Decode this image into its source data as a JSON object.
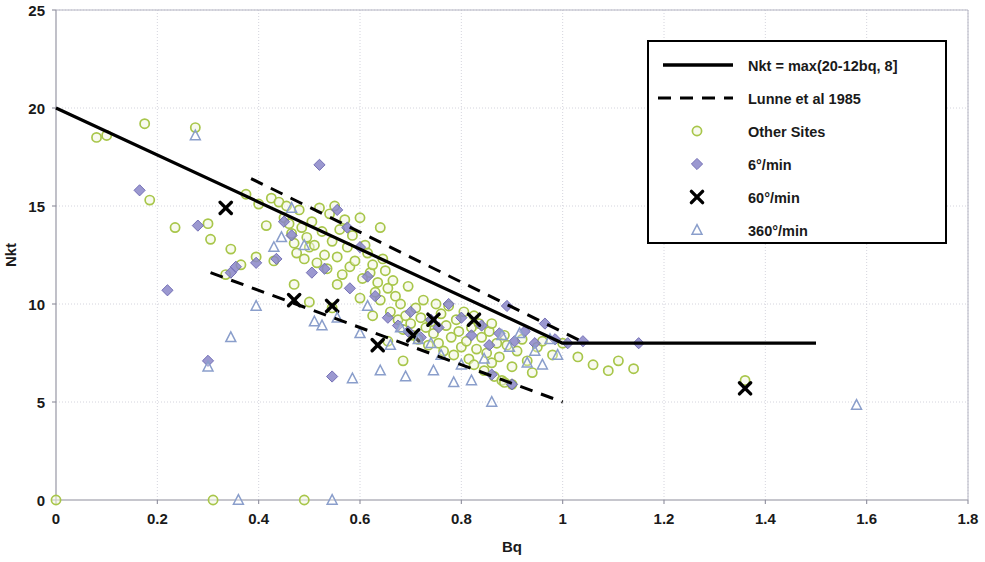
{
  "chart_data": {
    "type": "scatter",
    "title": "",
    "xlabel": "Bq",
    "ylabel": "Nkt",
    "xlim": [
      0,
      1.8
    ],
    "ylim": [
      0,
      25
    ],
    "xticks": [
      "0",
      "0.2",
      "0.4",
      "0.6",
      "0.8",
      "1",
      "1.2",
      "1.4",
      "1.6",
      "1.8"
    ],
    "xtick_values": [
      0,
      0.2,
      0.4,
      0.6,
      0.8,
      1.0,
      1.2,
      1.4,
      1.6,
      1.8
    ],
    "yticks": [
      "0",
      "5",
      "10",
      "15",
      "20",
      "25"
    ],
    "ytick_values": [
      0,
      5,
      10,
      15,
      20,
      25
    ],
    "grid": true,
    "legend_position": "top-right",
    "legend": [
      {
        "label": "Nkt = max(20-12bq, 8]",
        "marker": "solid-line",
        "color": "#000000"
      },
      {
        "label": "Lunne et al 1985",
        "marker": "dashed-line",
        "color": "#000000"
      },
      {
        "label": "Other Sites",
        "marker": "circle",
        "color": "#a8c64a"
      },
      {
        "label": "6°/min",
        "marker": "diamond",
        "color": "#8a86c8"
      },
      {
        "label": "60°/min",
        "marker": "cross",
        "color": "#000000"
      },
      {
        "label": "360°/min",
        "marker": "triangle",
        "color": "#8a9ecb"
      }
    ],
    "lines": [
      {
        "name": "Nkt = max(20-12bq, 8]",
        "style": "solid",
        "color": "#000000",
        "width": 3.2,
        "points": [
          [
            0,
            20
          ],
          [
            1.0,
            8
          ],
          [
            1.5,
            8
          ]
        ]
      },
      {
        "name": "Lunne et al 1985 upper",
        "style": "dashed",
        "color": "#000000",
        "width": 3.0,
        "points": [
          [
            0.385,
            16.4
          ],
          [
            1.045,
            8.0
          ]
        ]
      },
      {
        "name": "Lunne et al 1985 lower",
        "style": "dashed",
        "color": "#000000",
        "width": 3.0,
        "points": [
          [
            0.305,
            11.6
          ],
          [
            1.0,
            5.0
          ]
        ]
      }
    ],
    "series": [
      {
        "name": "Other Sites",
        "marker": "circle",
        "color": "#a8c64a",
        "points": [
          [
            0.0,
            0.0
          ],
          [
            0.31,
            0.0
          ],
          [
            0.49,
            0.0
          ],
          [
            0.08,
            18.5
          ],
          [
            0.1,
            18.6
          ],
          [
            0.175,
            19.2
          ],
          [
            0.185,
            15.3
          ],
          [
            0.275,
            19.0
          ],
          [
            0.3,
            14.1
          ],
          [
            0.235,
            13.9
          ],
          [
            0.305,
            13.3
          ],
          [
            0.345,
            12.8
          ],
          [
            0.375,
            15.6
          ],
          [
            0.4,
            15.1
          ],
          [
            0.425,
            15.4
          ],
          [
            0.44,
            15.2
          ],
          [
            0.45,
            14.4
          ],
          [
            0.455,
            15.0
          ],
          [
            0.46,
            14.1
          ],
          [
            0.465,
            13.6
          ],
          [
            0.47,
            13.1
          ],
          [
            0.475,
            12.6
          ],
          [
            0.48,
            14.8
          ],
          [
            0.485,
            13.9
          ],
          [
            0.49,
            12.3
          ],
          [
            0.495,
            13.4
          ],
          [
            0.5,
            12.9
          ],
          [
            0.505,
            14.2
          ],
          [
            0.51,
            13.0
          ],
          [
            0.515,
            12.1
          ],
          [
            0.52,
            14.9
          ],
          [
            0.525,
            13.7
          ],
          [
            0.53,
            12.5
          ],
          [
            0.535,
            11.8
          ],
          [
            0.54,
            14.6
          ],
          [
            0.545,
            13.2
          ],
          [
            0.55,
            15.0
          ],
          [
            0.555,
            12.4
          ],
          [
            0.56,
            13.8
          ],
          [
            0.565,
            11.5
          ],
          [
            0.57,
            14.3
          ],
          [
            0.575,
            12.9
          ],
          [
            0.58,
            11.9
          ],
          [
            0.585,
            13.5
          ],
          [
            0.59,
            12.2
          ],
          [
            0.6,
            14.4
          ],
          [
            0.605,
            11.3
          ],
          [
            0.61,
            13.0
          ],
          [
            0.615,
            12.6
          ],
          [
            0.62,
            11.6
          ],
          [
            0.625,
            12.0
          ],
          [
            0.63,
            10.6
          ],
          [
            0.635,
            11.1
          ],
          [
            0.64,
            10.2
          ],
          [
            0.645,
            12.3
          ],
          [
            0.65,
            11.7
          ],
          [
            0.655,
            10.8
          ],
          [
            0.66,
            9.6
          ],
          [
            0.665,
            11.2
          ],
          [
            0.67,
            10.4
          ],
          [
            0.675,
            9.2
          ],
          [
            0.68,
            10.0
          ],
          [
            0.685,
            8.7
          ],
          [
            0.69,
            9.4
          ],
          [
            0.695,
            10.9
          ],
          [
            0.7,
            9.0
          ],
          [
            0.705,
            8.4
          ],
          [
            0.71,
            9.8
          ],
          [
            0.715,
            8.2
          ],
          [
            0.72,
            9.3
          ],
          [
            0.725,
            10.2
          ],
          [
            0.73,
            8.8
          ],
          [
            0.735,
            7.9
          ],
          [
            0.74,
            9.1
          ],
          [
            0.745,
            8.5
          ],
          [
            0.75,
            10.0
          ],
          [
            0.755,
            8.0
          ],
          [
            0.76,
            9.5
          ],
          [
            0.765,
            7.6
          ],
          [
            0.77,
            8.9
          ],
          [
            0.775,
            9.9
          ],
          [
            0.78,
            8.3
          ],
          [
            0.785,
            7.4
          ],
          [
            0.79,
            9.2
          ],
          [
            0.795,
            8.6
          ],
          [
            0.8,
            7.8
          ],
          [
            0.805,
            9.6
          ],
          [
            0.81,
            8.1
          ],
          [
            0.815,
            7.2
          ],
          [
            0.82,
            8.8
          ],
          [
            0.825,
            6.9
          ],
          [
            0.83,
            7.7
          ],
          [
            0.835,
            9.0
          ],
          [
            0.84,
            8.3
          ],
          [
            0.845,
            6.6
          ],
          [
            0.85,
            7.5
          ],
          [
            0.855,
            8.6
          ],
          [
            0.86,
            7.0
          ],
          [
            0.865,
            6.3
          ],
          [
            0.87,
            8.0
          ],
          [
            0.875,
            7.3
          ],
          [
            0.88,
            6.1
          ],
          [
            0.885,
            8.4
          ],
          [
            0.89,
            7.9
          ],
          [
            0.9,
            6.8
          ],
          [
            0.91,
            7.6
          ],
          [
            0.92,
            8.2
          ],
          [
            0.93,
            7.1
          ],
          [
            0.94,
            6.5
          ],
          [
            0.95,
            7.8
          ],
          [
            0.96,
            8.1
          ],
          [
            0.98,
            7.4
          ],
          [
            1.0,
            8.0
          ],
          [
            1.03,
            7.3
          ],
          [
            1.06,
            6.9
          ],
          [
            1.09,
            6.6
          ],
          [
            1.11,
            7.1
          ],
          [
            1.14,
            6.7
          ],
          [
            1.36,
            6.1
          ],
          [
            0.415,
            14.0
          ],
          [
            0.43,
            12.2
          ],
          [
            0.555,
            11.0
          ],
          [
            0.6,
            10.3
          ],
          [
            0.64,
            13.9
          ],
          [
            0.395,
            12.4
          ],
          [
            0.335,
            11.5
          ],
          [
            0.365,
            12.0
          ],
          [
            0.47,
            11.0
          ],
          [
            0.5,
            10.1
          ],
          [
            0.545,
            9.8
          ],
          [
            0.625,
            9.4
          ],
          [
            0.655,
            8.1
          ],
          [
            0.685,
            7.1
          ],
          [
            0.825,
            9.4
          ],
          [
            0.86,
            9.0
          ],
          [
            0.885,
            6.0
          ],
          [
            0.9,
            5.9
          ]
        ]
      },
      {
        "name": "6°/min",
        "marker": "diamond",
        "color": "#8a86c8",
        "points": [
          [
            0.165,
            15.8
          ],
          [
            0.28,
            14.0
          ],
          [
            0.22,
            10.7
          ],
          [
            0.3,
            7.1
          ],
          [
            0.345,
            11.6
          ],
          [
            0.355,
            11.9
          ],
          [
            0.395,
            12.1
          ],
          [
            0.45,
            14.2
          ],
          [
            0.465,
            13.5
          ],
          [
            0.52,
            17.1
          ],
          [
            0.53,
            11.8
          ],
          [
            0.545,
            6.3
          ],
          [
            0.555,
            14.8
          ],
          [
            0.575,
            13.9
          ],
          [
            0.6,
            12.9
          ],
          [
            0.615,
            11.4
          ],
          [
            0.63,
            10.4
          ],
          [
            0.655,
            9.3
          ],
          [
            0.675,
            8.9
          ],
          [
            0.695,
            8.6
          ],
          [
            0.72,
            8.3
          ],
          [
            0.74,
            9.2
          ],
          [
            0.755,
            8.8
          ],
          [
            0.775,
            10.0
          ],
          [
            0.8,
            9.3
          ],
          [
            0.82,
            8.4
          ],
          [
            0.84,
            8.9
          ],
          [
            0.855,
            7.9
          ],
          [
            0.875,
            8.5
          ],
          [
            0.89,
            9.9
          ],
          [
            0.905,
            8.1
          ],
          [
            0.925,
            8.6
          ],
          [
            0.945,
            8.0
          ],
          [
            0.965,
            9.0
          ],
          [
            0.985,
            8.2
          ],
          [
            1.01,
            8.0
          ],
          [
            1.04,
            8.1
          ],
          [
            1.15,
            8.0
          ],
          [
            0.435,
            12.3
          ],
          [
            0.505,
            11.6
          ],
          [
            0.58,
            10.8
          ],
          [
            0.7,
            9.6
          ],
          [
            0.86,
            6.4
          ],
          [
            0.9,
            5.9
          ]
        ]
      },
      {
        "name": "60°/min",
        "marker": "cross",
        "color": "#000000",
        "points": [
          [
            0.335,
            14.9
          ],
          [
            0.47,
            10.2
          ],
          [
            0.545,
            9.9
          ],
          [
            0.635,
            7.9
          ],
          [
            0.705,
            8.4
          ],
          [
            0.745,
            9.2
          ],
          [
            0.825,
            9.2
          ],
          [
            1.36,
            5.7
          ]
        ]
      },
      {
        "name": "360°/min",
        "marker": "triangle",
        "color": "#8a9ecb",
        "points": [
          [
            0.36,
            0.0
          ],
          [
            0.545,
            0.0
          ],
          [
            0.275,
            18.6
          ],
          [
            0.3,
            6.8
          ],
          [
            0.345,
            8.3
          ],
          [
            0.395,
            9.9
          ],
          [
            0.43,
            12.9
          ],
          [
            0.445,
            13.4
          ],
          [
            0.465,
            14.9
          ],
          [
            0.51,
            9.1
          ],
          [
            0.525,
            8.9
          ],
          [
            0.585,
            6.2
          ],
          [
            0.615,
            9.9
          ],
          [
            0.64,
            6.6
          ],
          [
            0.66,
            7.9
          ],
          [
            0.69,
            6.3
          ],
          [
            0.715,
            8.2
          ],
          [
            0.745,
            6.6
          ],
          [
            0.76,
            7.4
          ],
          [
            0.785,
            6.0
          ],
          [
            0.8,
            6.9
          ],
          [
            0.82,
            6.1
          ],
          [
            0.845,
            7.2
          ],
          [
            0.86,
            5.0
          ],
          [
            0.88,
            8.4
          ],
          [
            0.895,
            7.8
          ],
          [
            0.915,
            8.5
          ],
          [
            0.93,
            7.0
          ],
          [
            0.945,
            7.6
          ],
          [
            0.96,
            6.9
          ],
          [
            0.975,
            8.2
          ],
          [
            0.99,
            7.4
          ],
          [
            1.58,
            4.85
          ],
          [
            0.49,
            13.0
          ],
          [
            0.555,
            9.3
          ],
          [
            0.6,
            8.5
          ],
          [
            0.68,
            8.8
          ],
          [
            0.74,
            8.0
          ]
        ]
      }
    ]
  }
}
